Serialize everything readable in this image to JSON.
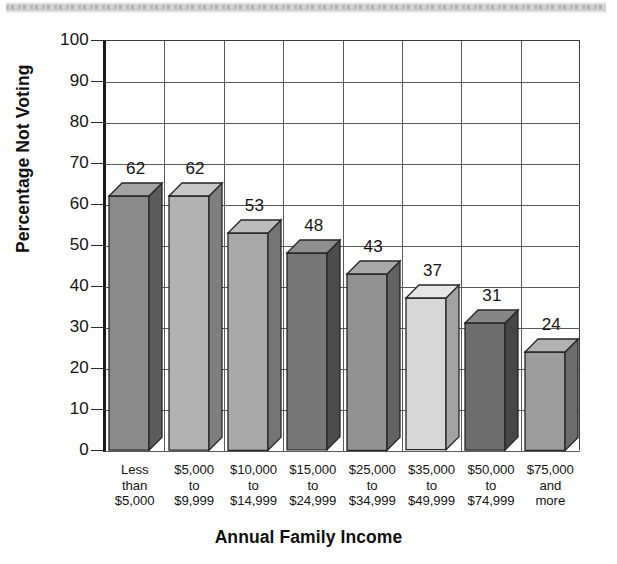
{
  "chart_data": {
    "type": "bar",
    "title": "",
    "xlabel": "Annual Family Income",
    "ylabel": "Percentage Not Voting",
    "ylim": [
      0,
      100
    ],
    "ytick_labels": [
      "100",
      "90",
      "80",
      "70",
      "60",
      "50",
      "40",
      "30",
      "20",
      "10",
      "0"
    ],
    "ytick_values": [
      100,
      90,
      80,
      70,
      60,
      50,
      40,
      30,
      20,
      10,
      0
    ],
    "grid": "horizontal and vertical gridlines",
    "legend": "none",
    "style": "3d-bars-grayscale",
    "categories": [
      "Less\nthan\n$5,000",
      "$5,000\nto\n$9,999",
      "$10,000\nto\n$14,999",
      "$15,000\nto\n$24,999",
      "$25,000\nto\n$34,999",
      "$35,000\nto\n$49,999",
      "$50,000\nto\n$74,999",
      "$75,000\nand\nmore"
    ],
    "values": [
      62,
      62,
      53,
      48,
      43,
      37,
      31,
      24
    ],
    "value_labels": [
      "62",
      "62",
      "53",
      "48",
      "43",
      "37",
      "31",
      "24"
    ],
    "bar_colors": [
      "#8a8a8a",
      "#b3b3b3",
      "#a8a8a8",
      "#777777",
      "#929292",
      "#d7d7d7",
      "#6d6d6d",
      "#9d9d9d"
    ],
    "bar_side_colors": [
      "#5c5c5c",
      "#7f7f7f",
      "#757575",
      "#4c4c4c",
      "#626262",
      "#a3a3a3",
      "#464646",
      "#6c6c6c"
    ],
    "bar_top_colors": [
      "#a3a3a3",
      "#c7c7c7",
      "#bcbcbc",
      "#8e8e8e",
      "#a8a8a8",
      "#e6e6e6",
      "#868686",
      "#b2b2b2"
    ]
  },
  "colors": {
    "axis": "#1a1a1a",
    "gridline": "#5a5a5a",
    "text": "#141414",
    "background": "#ffffff"
  }
}
